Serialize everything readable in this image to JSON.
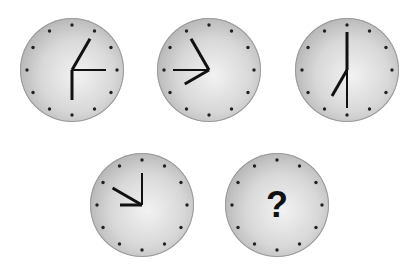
{
  "puzzle": {
    "clocks": [
      {
        "id": 1,
        "cx": 72,
        "cy": 70,
        "hands": [
          {
            "angle": 30,
            "length": 36,
            "width": 3
          },
          {
            "angle": 90,
            "length": 34,
            "width": 2
          },
          {
            "angle": 180,
            "length": 30,
            "width": 3
          }
        ]
      },
      {
        "id": 2,
        "cx": 209,
        "cy": 70,
        "hands": [
          {
            "angle": 330,
            "length": 36,
            "width": 3
          },
          {
            "angle": 270,
            "length": 36,
            "width": 2
          },
          {
            "angle": 240,
            "length": 28,
            "width": 3
          }
        ]
      },
      {
        "id": 3,
        "cx": 347,
        "cy": 70,
        "hands": [
          {
            "angle": 0,
            "length": 38,
            "width": 3
          },
          {
            "angle": 180,
            "length": 38,
            "width": 2
          },
          {
            "angle": 210,
            "length": 30,
            "width": 3
          }
        ]
      },
      {
        "id": 4,
        "cx": 142,
        "cy": 205,
        "hands": [
          {
            "angle": 0,
            "length": 32,
            "width": 2
          },
          {
            "angle": 300,
            "length": 34,
            "width": 3
          },
          {
            "angle": 270,
            "length": 22,
            "width": 3
          }
        ]
      },
      {
        "id": 5,
        "cx": 277,
        "cy": 205,
        "hands": [],
        "question": "?"
      }
    ],
    "colors": {
      "hand": "#111111",
      "dot": "#222222"
    }
  }
}
